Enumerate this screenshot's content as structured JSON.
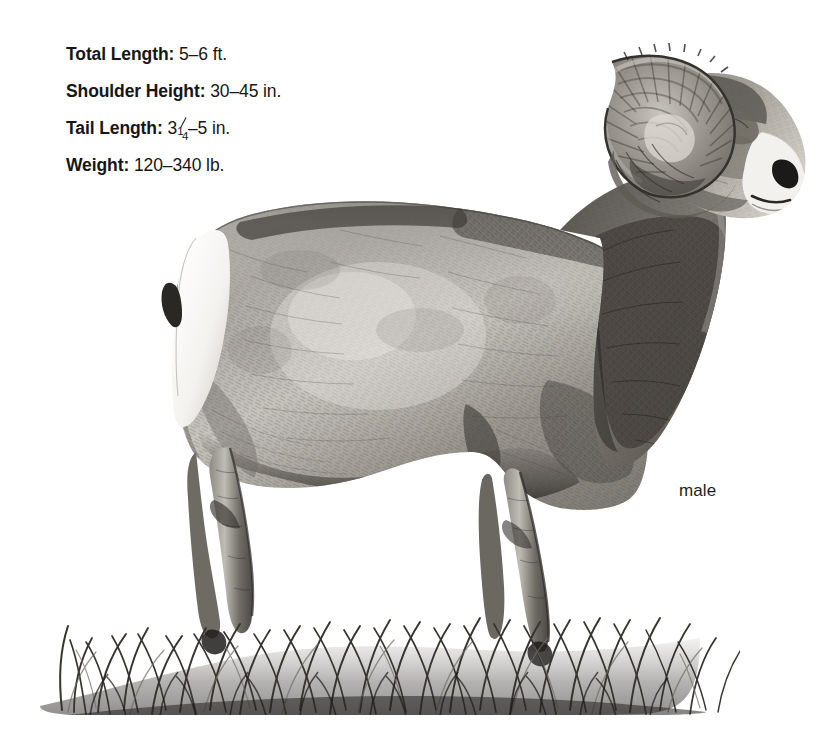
{
  "page": {
    "background_color": "#ffffff",
    "ink_color": "#161616",
    "width": 835,
    "height": 754
  },
  "stats": {
    "items": [
      {
        "label": "Total Length:",
        "value": "5–6 ft."
      },
      {
        "label": "Shoulder Height:",
        "value": "30–45 in."
      },
      {
        "label": "Tail Length:",
        "value_pre": "3",
        "fraction_num": "1",
        "fraction_den": "4",
        "value_post": "–5 in."
      },
      {
        "label": "Weight:",
        "value": "120–340 lb."
      }
    ]
  },
  "illustration": {
    "caption": "male",
    "subject": "bighorn-sheep-ram",
    "medium": "graphite-pencil-drawing",
    "features": [
      "massive-curled-horn",
      "white-rump-patch",
      "white-muzzle",
      "dark-neck-ruff",
      "grass-foreground"
    ]
  }
}
